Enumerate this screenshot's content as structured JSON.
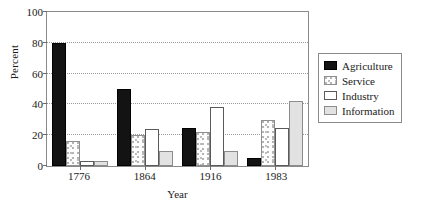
{
  "chart_data": {
    "type": "bar",
    "title": "",
    "xlabel": "Year",
    "ylabel": "Percent",
    "categories": [
      "1776",
      "1864",
      "1916",
      "1983"
    ],
    "series": [
      {
        "name": "Agriculture",
        "color": "#131313",
        "pattern": "solid-black",
        "values": [
          80,
          50,
          25,
          5
        ]
      },
      {
        "name": "Service",
        "color": "#fdfdfd",
        "pattern": "stippled",
        "values": [
          16,
          20,
          22,
          30
        ]
      },
      {
        "name": "Industry",
        "color": "#ffffff",
        "pattern": "open-white",
        "values": [
          3,
          24,
          38,
          25
        ]
      },
      {
        "name": "Information",
        "color": "#e2e2e2",
        "pattern": "light-gray",
        "values": [
          3,
          10,
          10,
          42
        ]
      }
    ],
    "ylim": [
      0,
      100
    ],
    "yticks": [
      0,
      20,
      40,
      60,
      80,
      100
    ],
    "ytick_labels": [
      "0",
      "20",
      "40",
      "60",
      "80",
      "100"
    ],
    "grid": "horizontal-dotted",
    "legend_position": "right"
  },
  "legend": {
    "entries": [
      "Agriculture",
      "Service",
      "Industry",
      "Information"
    ]
  },
  "axes": {
    "y_title": "Percent",
    "x_title": "Year"
  }
}
